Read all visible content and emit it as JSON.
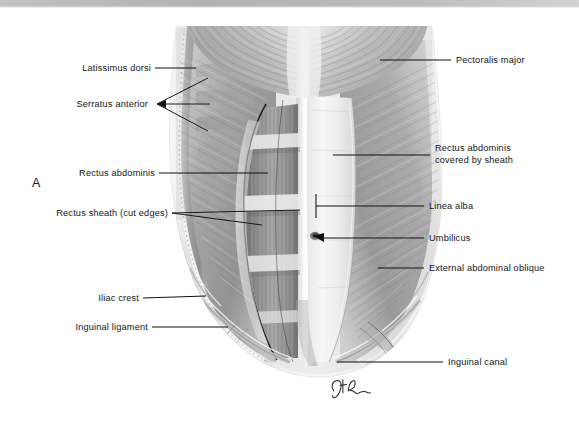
{
  "figure": {
    "panel_letter": "A",
    "signature": "artist-monogram",
    "background_color": "#ffffff",
    "top_band_color": "#b9b9b9",
    "label_color": "#141414",
    "leader_color": "#111111"
  },
  "labels_left": [
    {
      "id": "latissimus-dorsi",
      "text": "Latissimus dorsi"
    },
    {
      "id": "serratus-anterior",
      "text": "Serratus anterior"
    },
    {
      "id": "rectus-abdominis",
      "text": "Rectus abdominis"
    },
    {
      "id": "rectus-sheath",
      "text": "Rectus sheath (cut edges)"
    },
    {
      "id": "iliac-crest",
      "text": "Iliac crest"
    },
    {
      "id": "inguinal-ligament",
      "text": "Inguinal ligament"
    }
  ],
  "labels_right": [
    {
      "id": "pectoralis-major",
      "text": "Pectoralis major"
    },
    {
      "id": "rectus-abdominis-sheathed-1",
      "text": "Rectus abdominis"
    },
    {
      "id": "rectus-abdominis-sheathed-2",
      "text": "covered by sheath"
    },
    {
      "id": "linea-alba",
      "text": "Linea alba"
    },
    {
      "id": "umbilicus",
      "text": "Umbilicus"
    },
    {
      "id": "external-abdominal-oblique",
      "text": "External abdominal oblique"
    },
    {
      "id": "inguinal-canal",
      "text": "Inguinal canal"
    }
  ]
}
